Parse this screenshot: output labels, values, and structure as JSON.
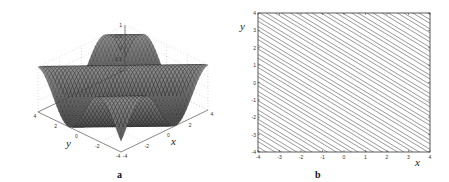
{
  "figure": {
    "panels": [
      {
        "id": "a",
        "label": "a"
      },
      {
        "id": "b",
        "label": "b"
      }
    ]
  },
  "chart_data": [
    {
      "type": "surface",
      "panel_label": "a",
      "title": "",
      "xlabel": "x",
      "ylabel": "y",
      "zlabel": "",
      "x_range": [
        -4,
        4
      ],
      "y_range": [
        -4,
        4
      ],
      "z_range": [
        -1,
        1
      ],
      "x_ticks": [
        "-4",
        "-2",
        "0",
        "2",
        "4"
      ],
      "y_ticks": [
        "4",
        "2",
        "0",
        "-2",
        "-4"
      ],
      "z_ticks": [
        "1",
        "0.5",
        "0",
        "-0.5",
        "-1"
      ],
      "grid": true,
      "description": "3D mesh surface of a plane-wave sin(x+y)-like function oscillating between -1 and 1 over [-4,4]x[-4,4]"
    },
    {
      "type": "line",
      "panel_label": "b",
      "title": "",
      "xlabel": "x",
      "ylabel": "y",
      "xlim": [
        -4,
        4
      ],
      "ylim": [
        -4,
        4
      ],
      "x_ticks": [
        "-4",
        "-3",
        "-2",
        "-1",
        "0",
        "1",
        "2",
        "3",
        "4"
      ],
      "y_ticks": [
        "4",
        "3",
        "2",
        "1",
        "0",
        "-1",
        "-2",
        "-3",
        "-4"
      ],
      "grid": false,
      "description": "Contour plot of parallel diagonal level lines with negative slope (approx -0.75), grouped in pairs/triplets",
      "line_slope": -0.75,
      "line_count": 30
    }
  ]
}
